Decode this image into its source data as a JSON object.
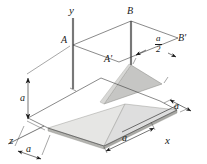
{
  "figure": {
    "type": "isometric-engineering-diagram",
    "background_color": "#ffffff",
    "line_color": "#1a1a1a",
    "axes": [
      {
        "name": "y-axis",
        "label": "y"
      },
      {
        "name": "x-axis",
        "label": "x"
      },
      {
        "name": "z-axis",
        "label": "z"
      }
    ],
    "points": [
      {
        "name": "point-A",
        "label": "A"
      },
      {
        "name": "point-A-prime",
        "label": "A'"
      },
      {
        "name": "point-B",
        "label": "B"
      },
      {
        "name": "point-B-prime",
        "label": "B'"
      }
    ],
    "dimensions": [
      {
        "name": "dim-height-a",
        "label": "a",
        "orientation": "vertical"
      },
      {
        "name": "dim-depth-a",
        "label": "a",
        "orientation": "along-z"
      },
      {
        "name": "dim-width-a",
        "label": "a",
        "orientation": "along-x-front"
      },
      {
        "name": "dim-side-a",
        "label": "a",
        "orientation": "along-x-right"
      }
    ],
    "fraction_labels": [
      {
        "name": "dim-half-a",
        "numerator": "a",
        "denominator": "2"
      }
    ],
    "surfaces": [
      {
        "name": "lower-triangular-plate",
        "fill": "#e3e3e1",
        "edge": "#b8b8b4"
      },
      {
        "name": "upper-triangular-plate",
        "fill": "#c9c9c7",
        "edge": "#9e9e9a"
      },
      {
        "name": "right-triangular-plate",
        "fill": "#dcdcda",
        "edge": "#b0b0ac"
      }
    ]
  }
}
